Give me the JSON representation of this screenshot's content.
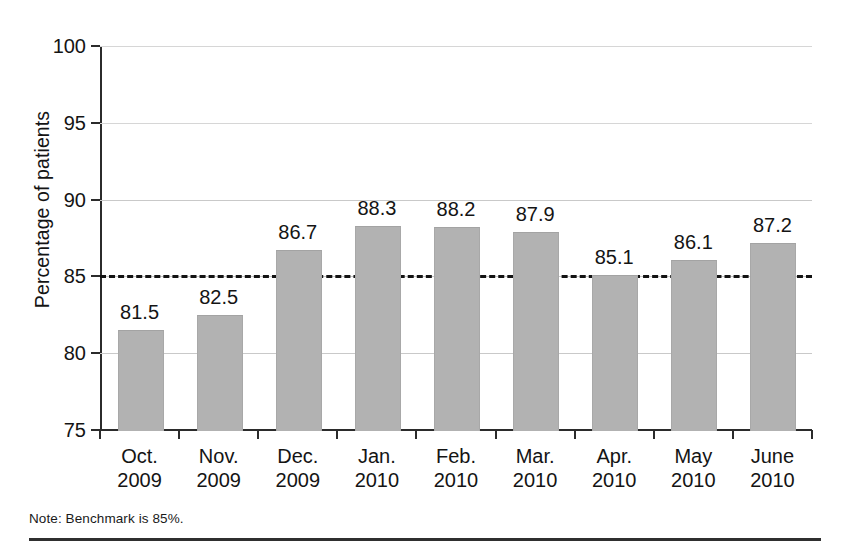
{
  "figure": {
    "note": "Note: Benchmark is 85%.",
    "bar_color": "#b2b2b2",
    "benchmark_line_color": "#131313",
    "axis_color": "#2b2b2b",
    "gridline_color": "#c9c9c9"
  },
  "chart_data": {
    "type": "bar",
    "title": "",
    "subtitle": "",
    "xlabel": "",
    "ylabel": "Percentage of patients",
    "categories": [
      "Oct. 2009",
      "Nov. 2009",
      "Dec. 2009",
      "Jan. 2010",
      "Feb. 2010",
      "Mar. 2010",
      "Apr. 2010",
      "May 2010",
      "June 2010"
    ],
    "category_lines": [
      {
        "month": "Oct.",
        "year": "2009"
      },
      {
        "month": "Nov.",
        "year": "2009"
      },
      {
        "month": "Dec.",
        "year": "2009"
      },
      {
        "month": "Jan.",
        "year": "2010"
      },
      {
        "month": "Feb.",
        "year": "2010"
      },
      {
        "month": "Mar.",
        "year": "2010"
      },
      {
        "month": "Apr.",
        "year": "2010"
      },
      {
        "month": "May",
        "year": "2010"
      },
      {
        "month": "June",
        "year": "2010"
      }
    ],
    "values": [
      81.5,
      82.5,
      86.7,
      88.3,
      88.2,
      87.9,
      85.1,
      86.1,
      87.2
    ],
    "value_labels": [
      "81.5",
      "82.5",
      "86.7",
      "88.3",
      "88.2",
      "87.9",
      "85.1",
      "86.1",
      "87.2"
    ],
    "ylim": [
      75,
      100
    ],
    "yticks": [
      75,
      80,
      85,
      90,
      95,
      100
    ],
    "ytick_labels": [
      "75",
      "80",
      "85",
      "90",
      "95",
      "100"
    ],
    "grid": true,
    "legend": "none",
    "annotations": [
      {
        "name": "benchmark",
        "value": 85,
        "style": "dashed horizontal line",
        "label": "Benchmark is 85%."
      }
    ]
  }
}
